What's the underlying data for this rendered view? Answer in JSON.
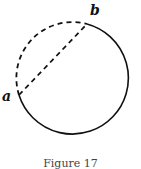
{
  "figure": {
    "labels": {
      "a": "a",
      "b": "b"
    },
    "caption": "Figure 17",
    "stroke_color": "#111111"
  }
}
